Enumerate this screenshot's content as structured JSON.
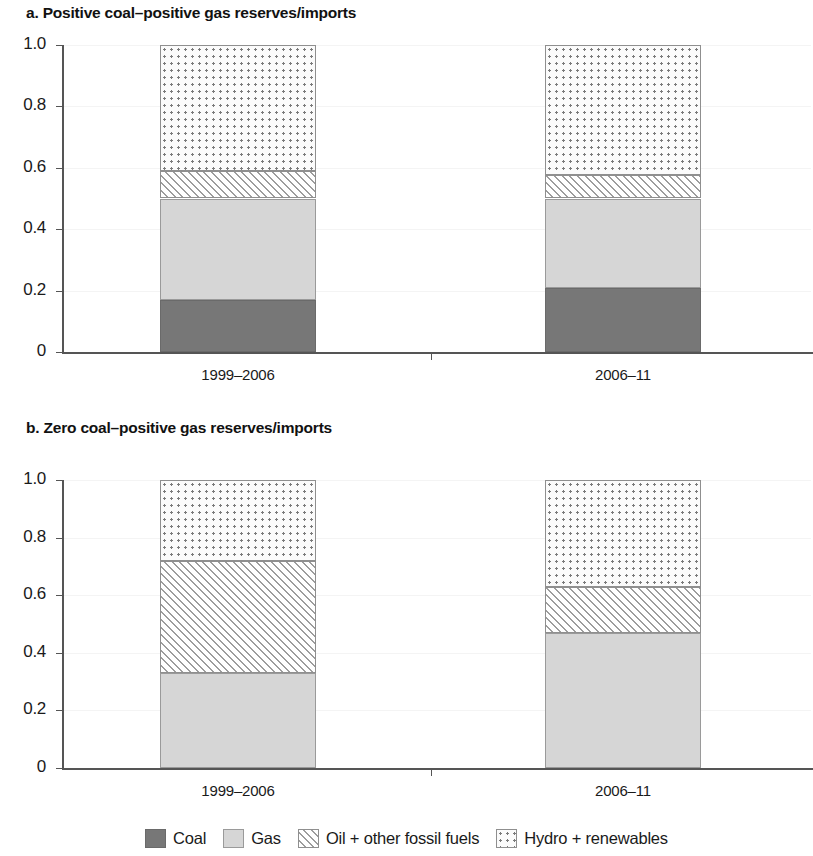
{
  "figure": {
    "panels": [
      {
        "id": "a",
        "title": "a. Positive coal–positive gas reserves/imports"
      },
      {
        "id": "b",
        "title": "b. Zero coal–positive gas reserves/imports"
      }
    ]
  },
  "legend": {
    "items": [
      {
        "key": "coal",
        "label": "Coal",
        "swatch": "solid-dark-gray-swatch"
      },
      {
        "key": "gas",
        "label": "Gas",
        "swatch": "solid-light-gray-swatch"
      },
      {
        "key": "oil",
        "label": "Oil + other fossil fuels",
        "swatch": "diagonal-hatch-swatch"
      },
      {
        "key": "hydro",
        "label": "Hydro + renewables",
        "swatch": "dotted-swatch"
      }
    ]
  },
  "axes": {
    "y_ticks": [
      "1.0",
      "0.8",
      "0.6",
      "0.4",
      "0.2",
      "0"
    ],
    "y_values": [
      1.0,
      0.8,
      0.6,
      0.4,
      0.2,
      0
    ],
    "x_ticks": [
      "1999–2006",
      "2006–11"
    ]
  },
  "colors": {
    "coal": "#777777",
    "gas": "#d6d6d6",
    "oil": "#ffffff",
    "hydro": "#fbfbfb",
    "axis": "#555555",
    "text": "#1a1a1a",
    "background": "#ffffff"
  },
  "chart_data": [
    {
      "type": "bar",
      "stacked": true,
      "normalized": true,
      "title": "a. Positive coal–positive gas reserves/imports",
      "xlabel": "",
      "ylabel": "",
      "ylim": [
        0,
        1.0
      ],
      "ytick_values": [
        0,
        0.2,
        0.4,
        0.6,
        0.8,
        1.0
      ],
      "grid": false,
      "legend_position": "bottom",
      "categories": [
        "1999–2006",
        "2006–11"
      ],
      "series": [
        {
          "name": "Coal",
          "values": [
            0.17,
            0.21
          ]
        },
        {
          "name": "Gas",
          "values": [
            0.33,
            0.29
          ]
        },
        {
          "name": "Oil + other fossil fuels",
          "values": [
            0.09,
            0.075
          ]
        },
        {
          "name": "Hydro + renewables",
          "values": [
            0.41,
            0.425
          ]
        }
      ]
    },
    {
      "type": "bar",
      "stacked": true,
      "normalized": true,
      "title": "b. Zero coal–positive gas reserves/imports",
      "xlabel": "",
      "ylabel": "",
      "ylim": [
        0,
        1.0
      ],
      "ytick_values": [
        0,
        0.2,
        0.4,
        0.6,
        0.8,
        1.0
      ],
      "grid": false,
      "legend_position": "bottom",
      "categories": [
        "1999–2006",
        "2006–11"
      ],
      "series": [
        {
          "name": "Coal",
          "values": [
            0.0,
            0.0
          ]
        },
        {
          "name": "Gas",
          "values": [
            0.33,
            0.47
          ]
        },
        {
          "name": "Oil + other fossil fuels",
          "values": [
            0.39,
            0.16
          ]
        },
        {
          "name": "Hydro + renewables",
          "values": [
            0.28,
            0.37
          ]
        }
      ]
    }
  ]
}
